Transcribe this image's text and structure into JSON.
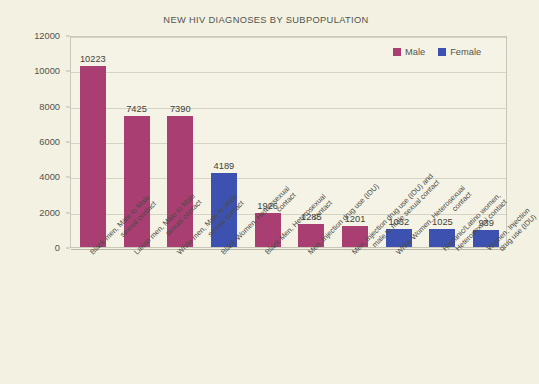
{
  "chart_data": {
    "type": "bar",
    "title": "NEW HIV DIAGNOSES BY SUBPOPULATION",
    "xlabel": "",
    "ylabel": "",
    "ylim": [
      0,
      12000
    ],
    "ytick_step": 2000,
    "yticks": [
      "0",
      "2000",
      "4000",
      "6000",
      "8000",
      "10000",
      "12000"
    ],
    "grid": true,
    "legend_position": "top-right",
    "colors": {
      "male": "#A83E72",
      "female": "#3D52B0",
      "background": "#f2f1e2",
      "plot_background": "#f4f3e5",
      "gridline": "#d5d4c4",
      "text": "#53534c"
    },
    "legend": [
      {
        "name": "Male",
        "color": "#A83E72"
      },
      {
        "name": "Female",
        "color": "#3D52B0"
      }
    ],
    "categories": [
      "Black men, Male to Male sexual contact",
      "Latino men, Male to Male sexual contact",
      "White men, Male to Male sexual contact",
      "Black Women, Heterosexual contact",
      "Black Men, Heterosexual contact",
      "Men, Injection drug use (IDU)",
      "Men, Injection drug use (IDU) and male to male sexual contact",
      "White Women, Heterosexual contact",
      "Hispanic/Latino women, Heterosexual contact",
      "Women, Injection drug use (IDU)"
    ],
    "values": [
      10223,
      7425,
      7390,
      4189,
      1926,
      1285,
      1201,
      1032,
      1025,
      939
    ],
    "series_of_each_bar": [
      "Male",
      "Male",
      "Male",
      "Female",
      "Male",
      "Male",
      "Male",
      "Female",
      "Female",
      "Female"
    ],
    "bars": [
      {
        "label_line1": "Black men, Male to Male",
        "label_line2": "sexual contact",
        "value": 10223,
        "value_label": "10223",
        "series": "Male",
        "color": "#A83E72"
      },
      {
        "label_line1": "Latino men, Male to Male",
        "label_line2": "sexual contact",
        "value": 7425,
        "value_label": "7425",
        "series": "Male",
        "color": "#A83E72"
      },
      {
        "label_line1": "White men, Male to Male",
        "label_line2": "sexual contact",
        "value": 7390,
        "value_label": "7390",
        "series": "Male",
        "color": "#A83E72"
      },
      {
        "label_line1": "Black Women, Heterosexual",
        "label_line2": "contact",
        "value": 4189,
        "value_label": "4189",
        "series": "Female",
        "color": "#3D52B0"
      },
      {
        "label_line1": "Black Men, Heterosexual",
        "label_line2": "contact",
        "value": 1926,
        "value_label": "1926",
        "series": "Male",
        "color": "#A83E72"
      },
      {
        "label_line1": "Men, Injection drug use (IDU)",
        "label_line2": "",
        "value": 1285,
        "value_label": "1285",
        "series": "Male",
        "color": "#A83E72"
      },
      {
        "label_line1": "Men, Injection drug use (IDU) and",
        "label_line2": "male to male sexual contact",
        "value": 1201,
        "value_label": "1201",
        "series": "Male",
        "color": "#A83E72"
      },
      {
        "label_line1": "White Women, Heterosexual",
        "label_line2": "contact",
        "value": 1032,
        "value_label": "1032",
        "series": "Female",
        "color": "#3D52B0"
      },
      {
        "label_line1": "Hispanic/Latino women,",
        "label_line2": "Heterosexual contact",
        "value": 1025,
        "value_label": "1025",
        "series": "Female",
        "color": "#3D52B0"
      },
      {
        "label_line1": "Women, Injection",
        "label_line2": "drug use (IDU)",
        "value": 939,
        "value_label": "939",
        "series": "Female",
        "color": "#3D52B0"
      }
    ]
  }
}
